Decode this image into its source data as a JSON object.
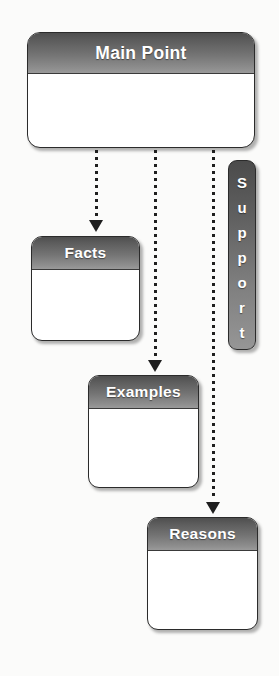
{
  "diagram": {
    "type": "hierarchy-flow",
    "background_color": "#fbfbfa",
    "accent_color": "#747474",
    "text_color": "#ffffff",
    "outline_color": "#2b2b2b"
  },
  "root": {
    "label": "Main Point"
  },
  "side_tab": {
    "label": "Support",
    "orientation": "vertical",
    "letters": [
      "S",
      "u",
      "p",
      "p",
      "o",
      "r",
      "t"
    ]
  },
  "nodes": [
    {
      "label": "Facts"
    },
    {
      "label": "Examples"
    },
    {
      "label": "Reasons"
    }
  ],
  "connectors": [
    {
      "from": "Main Point",
      "to": "Facts",
      "style": "dotted",
      "arrow": "down"
    },
    {
      "from": "Main Point",
      "to": "Examples",
      "style": "dotted",
      "arrow": "down"
    },
    {
      "from": "Main Point",
      "to": "Reasons",
      "style": "dotted",
      "arrow": "down"
    }
  ]
}
